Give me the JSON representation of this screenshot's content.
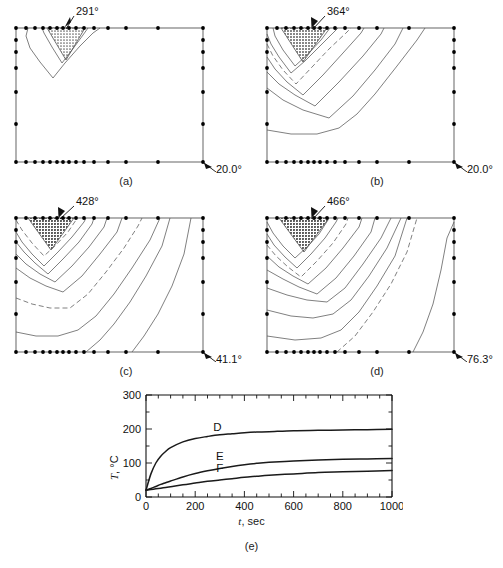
{
  "figure": {
    "title": "",
    "panels": [
      {
        "id": "a",
        "caption": "(a)",
        "hot_label": "291°",
        "cold_label": "20.0°",
        "n_contours": 3,
        "dashed_indices": []
      },
      {
        "id": "b",
        "caption": "(b)",
        "hot_label": "364°",
        "cold_label": "20.0°",
        "n_contours": 7,
        "dashed_indices": [
          3
        ]
      },
      {
        "id": "c",
        "caption": "(c)",
        "hot_label": "428°",
        "cold_label": "41.1°",
        "n_contours": 9,
        "dashed_indices": [
          5
        ]
      },
      {
        "id": "d",
        "caption": "(d)",
        "hot_label": "466°",
        "cold_label": "76.3°",
        "n_contours": 10,
        "dashed_indices": [
          4,
          8
        ]
      }
    ]
  },
  "chart_data": {
    "type": "line",
    "title": "",
    "caption": "(e)",
    "xlabel": "t, sec",
    "xlabel_italic_part": "t",
    "xlabel_rest": ", sec",
    "ylabel": "T, °C",
    "ylabel_italic_part": "T",
    "ylabel_rest": ", °C",
    "xlim": [
      0,
      1000
    ],
    "ylim": [
      0,
      300
    ],
    "xticks": [
      0,
      200,
      400,
      600,
      800,
      1000
    ],
    "xtick_labels": [
      "0",
      "200",
      "400",
      "600",
      "800",
      "1000"
    ],
    "yticks": [
      0,
      100,
      200,
      300
    ],
    "ytick_labels": [
      "0",
      "100",
      "200",
      "300"
    ],
    "xminor_step": 50,
    "yminor_step": 50,
    "grid": false,
    "legend_position": "inline-labels",
    "x": [
      0,
      20,
      40,
      60,
      80,
      100,
      150,
      200,
      250,
      300,
      350,
      400,
      450,
      500,
      600,
      700,
      800,
      900,
      1000
    ],
    "series": [
      {
        "name": "D",
        "label": "D",
        "label_x": 290,
        "label_y": 193,
        "values": [
          20,
          68,
          100,
          120,
          134,
          145,
          162,
          172,
          178,
          183,
          186,
          189,
          191,
          192,
          195,
          196,
          197,
          198,
          199
        ]
      },
      {
        "name": "E",
        "label": "E",
        "label_x": 300,
        "label_y": 108,
        "values": [
          20,
          25,
          31,
          37,
          42,
          47,
          59,
          69,
          77,
          84,
          90,
          95,
          99,
          102,
          106,
          109,
          111,
          112,
          113
        ]
      },
      {
        "name": "F",
        "label": "F",
        "label_x": 300,
        "label_y": 75,
        "values": [
          20,
          22,
          24,
          26,
          28,
          30,
          36,
          41,
          46,
          50,
          54,
          58,
          61,
          64,
          68,
          72,
          74,
          76,
          78
        ]
      }
    ]
  },
  "colors": {
    "line": "#1a1a1a",
    "contour": "#3a3a3a",
    "node": "#000000",
    "hatch_fill": "#8a8a8a",
    "background": "#ffffff"
  }
}
